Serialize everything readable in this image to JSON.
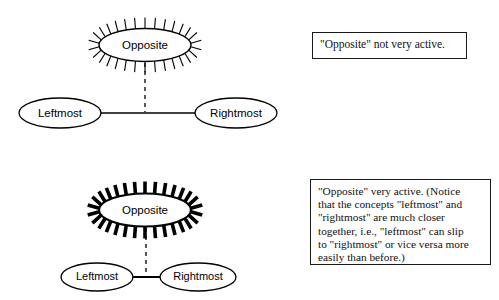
{
  "figure": {
    "title": "",
    "diagrams": [
      {
        "id": "inactive-state",
        "nodes": {
          "opposite": "Opposite",
          "leftmost": "Leftmost",
          "rightmost": "Rightmost"
        },
        "activation": "low",
        "spike_count": 30,
        "spike_style": "thin",
        "link_style": "solid",
        "dashed_link_style": "dashed"
      },
      {
        "id": "active-state",
        "nodes": {
          "opposite": "Opposite",
          "leftmost": "Leftmost",
          "rightmost": "Rightmost"
        },
        "activation": "high",
        "spike_count": 30,
        "spike_style": "thick",
        "link_style": "solid",
        "dashed_link_style": "dashed"
      }
    ],
    "callouts": {
      "top": {
        "text": "\"Opposite\" not very active."
      },
      "bottom": {
        "lines": [
          "\"Opposite\" very active. (Notice",
          "that the concepts \"leftmost\" and",
          "\"rightmost\" are much closer",
          "together, i.e., \"leftmost\" can slip",
          "to \"rightmost\" or vice versa more",
          "easily than before.)"
        ]
      }
    },
    "colors": {
      "stroke": "#000000",
      "background": "#ffffff",
      "box_border": "#1a1a1a"
    }
  }
}
